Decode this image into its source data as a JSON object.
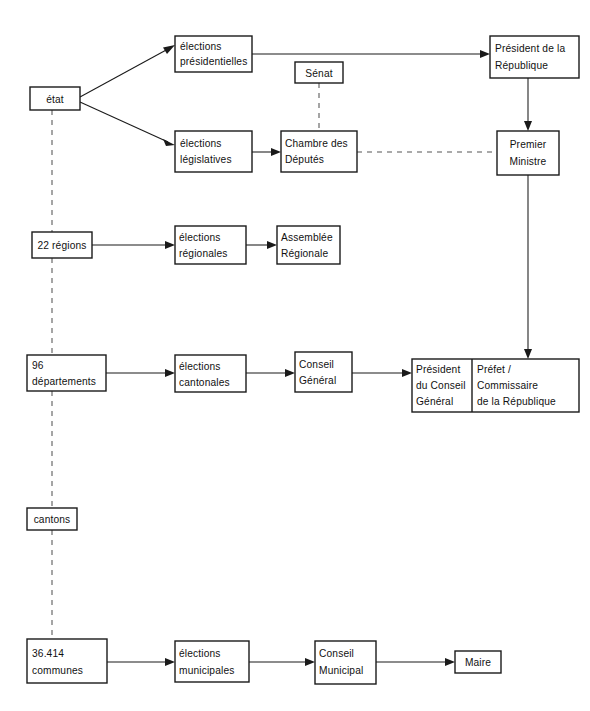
{
  "diagram": {
    "background_color": "#ffffff",
    "line_color": "#1a1a1a",
    "dashed_line_color": "#555555",
    "nodes": {
      "etat": {
        "label": "état"
      },
      "elections_presidentielles": {
        "line1": "élections",
        "line2": "présidentielles"
      },
      "senat": {
        "label": "Sénat"
      },
      "president_republique": {
        "line1": "Président de la",
        "line2": "République"
      },
      "elections_legislatives": {
        "line1": "élections",
        "line2": "législatives"
      },
      "chambre_deputes": {
        "line1": "Chambre des",
        "line2": "Députés"
      },
      "premier_ministre": {
        "line1": "Premier",
        "line2": "Ministre"
      },
      "regions": {
        "label": "22 régions"
      },
      "elections_regionales": {
        "line1": "élections",
        "line2": "régionales"
      },
      "assemblee_regionale": {
        "line1": "Assemblée",
        "line2": "Régionale"
      },
      "departements": {
        "line1": "96",
        "line2": "départements"
      },
      "elections_cantonales": {
        "line1": "élections",
        "line2": "cantonales"
      },
      "conseil_general": {
        "line1": "Conseil",
        "line2": "Général"
      },
      "president_conseil_general": {
        "line1": "Président",
        "line2": "du Conseil",
        "line3": "Général"
      },
      "prefet": {
        "line1": "Préfet /",
        "line2": "Commissaire",
        "line3": "de la République"
      },
      "cantons": {
        "label": "cantons"
      },
      "communes": {
        "line1": "36.414",
        "line2": "communes"
      },
      "elections_municipales": {
        "line1": "élections",
        "line2": "municipales"
      },
      "conseil_municipal": {
        "line1": "Conseil",
        "line2": "Municipal"
      },
      "maire": {
        "label": "Maire"
      }
    }
  }
}
